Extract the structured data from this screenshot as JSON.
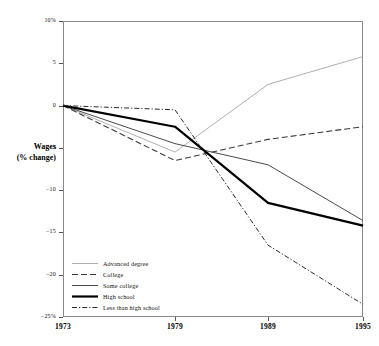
{
  "chart_data": {
    "type": "line",
    "title": "",
    "xlabel": "",
    "ylabel": "Wages (% change)",
    "ylabel_line1": "Wages",
    "ylabel_line2": "(% change)",
    "x": [
      1973,
      1979,
      1989,
      1995
    ],
    "xtick_labels": [
      "1973",
      "1979",
      "1989",
      "1995"
    ],
    "ytick_labels": [
      "10%",
      "5",
      "0",
      "−5",
      "−10",
      "−15",
      "−20",
      "−25%"
    ],
    "ytick_values": [
      10,
      5,
      0,
      -5,
      -10,
      -15,
      -20,
      -25
    ],
    "ylim": [
      -25,
      10
    ],
    "xlim": [
      1973,
      1995
    ],
    "grid": false,
    "legend_position": "bottom-left",
    "series": [
      {
        "name": "Advanced degree",
        "values": [
          0,
          -5.5,
          2.5,
          5.8
        ],
        "style": "solid-thin",
        "color": "#9a9a9a",
        "width": 0.8
      },
      {
        "name": "College",
        "values": [
          0,
          -6.5,
          -4.0,
          -2.5
        ],
        "style": "dashed",
        "color": "#3a3a3a",
        "width": 1.1
      },
      {
        "name": "Some college",
        "values": [
          0,
          -4.5,
          -7.0,
          -13.6
        ],
        "style": "solid",
        "color": "#4a4a4a",
        "width": 1.0
      },
      {
        "name": "High school",
        "values": [
          0,
          -2.5,
          -11.5,
          -14.2
        ],
        "style": "solid-thick",
        "color": "#000000",
        "width": 2.2
      },
      {
        "name": "Less than high school",
        "values": [
          0,
          -0.5,
          -16.5,
          -23.5
        ],
        "style": "dash-dot",
        "color": "#2a2a2a",
        "width": 1.0
      }
    ]
  },
  "legend": {
    "items": [
      {
        "label": "Advanced degree"
      },
      {
        "label": "College"
      },
      {
        "label": "Some college"
      },
      {
        "label": "High school"
      },
      {
        "label": "Less than high school"
      }
    ]
  },
  "axes": {
    "y_label_line1": "Wages",
    "y_label_line2": "(% change)",
    "y_ticks": [
      "10%",
      "5",
      "0",
      "−5",
      "−10",
      "−15",
      "−20",
      "−25%"
    ],
    "x_ticks": [
      "1973",
      "1979",
      "1989",
      "1995"
    ]
  },
  "colors": {
    "frame": "#8a8a8a",
    "text": "#111111",
    "advanced_degree": "#9a9a9a",
    "college": "#3a3a3a",
    "some_college": "#4a4a4a",
    "high_school": "#000000",
    "less_than_high_school": "#2a2a2a"
  }
}
